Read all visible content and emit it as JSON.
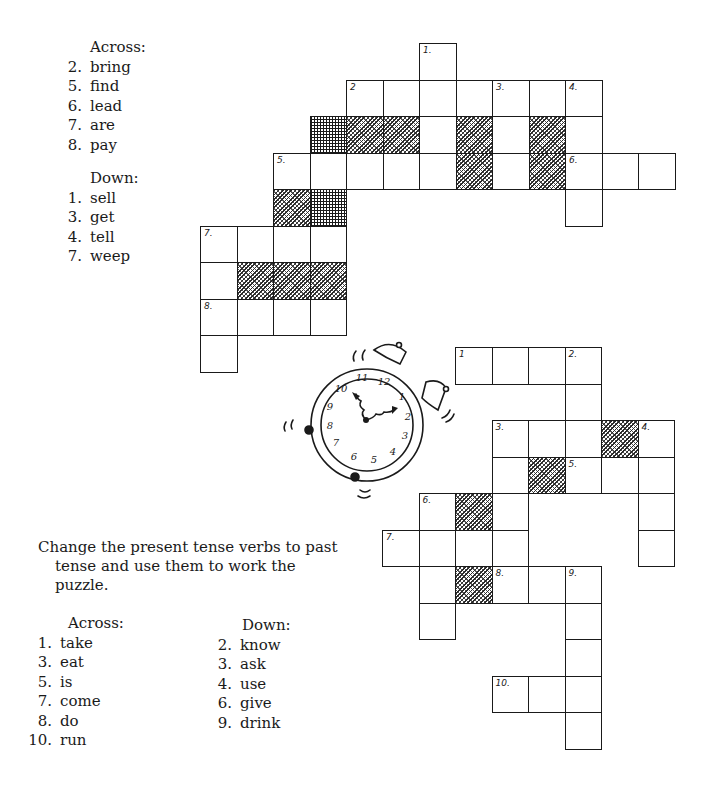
{
  "puzzle_top": {
    "across_header": "Across:",
    "across": [
      {
        "num": "2.",
        "word": "bring"
      },
      {
        "num": "5.",
        "word": "find"
      },
      {
        "num": "6.",
        "word": "lead"
      },
      {
        "num": "7.",
        "word": "are"
      },
      {
        "num": "8.",
        "word": "pay"
      }
    ],
    "down_header": "Down:",
    "down": [
      {
        "num": "1.",
        "word": "sell"
      },
      {
        "num": "3.",
        "word": "get"
      },
      {
        "num": "4.",
        "word": "tell"
      },
      {
        "num": "7.",
        "word": "weep"
      }
    ],
    "grid": {
      "origin": [
        200,
        43
      ],
      "cell": 36.5,
      "cells": [
        {
          "r": 0,
          "c": 6,
          "label": "1."
        },
        {
          "r": 1,
          "c": 4,
          "label": "2"
        },
        {
          "r": 1,
          "c": 5
        },
        {
          "r": 1,
          "c": 6
        },
        {
          "r": 1,
          "c": 7
        },
        {
          "r": 1,
          "c": 8,
          "label": "3."
        },
        {
          "r": 1,
          "c": 9
        },
        {
          "r": 1,
          "c": 10,
          "label": "4."
        },
        {
          "r": 2,
          "c": 3,
          "shade": "x"
        },
        {
          "r": 2,
          "c": 4,
          "shade": "d"
        },
        {
          "r": 2,
          "c": 5,
          "shade": "d"
        },
        {
          "r": 2,
          "c": 6
        },
        {
          "r": 2,
          "c": 7,
          "shade": "d"
        },
        {
          "r": 2,
          "c": 8
        },
        {
          "r": 2,
          "c": 9,
          "shade": "d"
        },
        {
          "r": 2,
          "c": 10
        },
        {
          "r": 3,
          "c": 2,
          "label": "5."
        },
        {
          "r": 3,
          "c": 3
        },
        {
          "r": 3,
          "c": 4
        },
        {
          "r": 3,
          "c": 5
        },
        {
          "r": 3,
          "c": 6
        },
        {
          "r": 3,
          "c": 7,
          "shade": "d"
        },
        {
          "r": 3,
          "c": 8
        },
        {
          "r": 3,
          "c": 9,
          "shade": "d"
        },
        {
          "r": 3,
          "c": 10,
          "label": "6."
        },
        {
          "r": 3,
          "c": 11
        },
        {
          "r": 3,
          "c": 12
        },
        {
          "r": 4,
          "c": 2,
          "shade": "d"
        },
        {
          "r": 4,
          "c": 3,
          "shade": "x"
        },
        {
          "r": 4,
          "c": 10
        },
        {
          "r": 5,
          "c": 0,
          "label": "7."
        },
        {
          "r": 5,
          "c": 1
        },
        {
          "r": 5,
          "c": 2
        },
        {
          "r": 5,
          "c": 3
        },
        {
          "r": 6,
          "c": 0
        },
        {
          "r": 6,
          "c": 1,
          "shade": "d"
        },
        {
          "r": 6,
          "c": 2,
          "shade": "d"
        },
        {
          "r": 6,
          "c": 3,
          "shade": "d"
        },
        {
          "r": 7,
          "c": 0,
          "label": "8."
        },
        {
          "r": 7,
          "c": 1
        },
        {
          "r": 7,
          "c": 2
        },
        {
          "r": 7,
          "c": 3
        },
        {
          "r": 8,
          "c": 0
        }
      ]
    }
  },
  "instructions": {
    "line1": "Change the present tense verbs to past",
    "line2": "tense and use them to work the",
    "line3": "puzzle."
  },
  "puzzle_bottom": {
    "across_header": "Across:",
    "across": [
      {
        "num": "1.",
        "word": "take"
      },
      {
        "num": "3.",
        "word": "eat"
      },
      {
        "num": "5.",
        "word": "is"
      },
      {
        "num": "7.",
        "word": "come"
      },
      {
        "num": "8.",
        "word": "do"
      },
      {
        "num": "10.",
        "word": "run"
      }
    ],
    "down_header": "Down:",
    "down": [
      {
        "num": "2.",
        "word": "know"
      },
      {
        "num": "3.",
        "word": "ask"
      },
      {
        "num": "4.",
        "word": "use"
      },
      {
        "num": "6.",
        "word": "give"
      },
      {
        "num": "9.",
        "word": "drink"
      }
    ],
    "grid": {
      "origin": [
        382,
        347
      ],
      "cell": 36.5,
      "cells": [
        {
          "r": 0,
          "c": 2,
          "label": "1"
        },
        {
          "r": 0,
          "c": 3
        },
        {
          "r": 0,
          "c": 4
        },
        {
          "r": 0,
          "c": 5,
          "label": "2."
        },
        {
          "r": 1,
          "c": 5
        },
        {
          "r": 2,
          "c": 3,
          "label": "3."
        },
        {
          "r": 2,
          "c": 4
        },
        {
          "r": 2,
          "c": 5
        },
        {
          "r": 2,
          "c": 6,
          "shade": "d"
        },
        {
          "r": 2,
          "c": 7,
          "label": "4."
        },
        {
          "r": 3,
          "c": 3
        },
        {
          "r": 3,
          "c": 4,
          "shade": "d"
        },
        {
          "r": 3,
          "c": 5,
          "label": "5."
        },
        {
          "r": 3,
          "c": 6
        },
        {
          "r": 3,
          "c": 7
        },
        {
          "r": 4,
          "c": 1,
          "label": "6."
        },
        {
          "r": 4,
          "c": 2,
          "shade": "d"
        },
        {
          "r": 4,
          "c": 3
        },
        {
          "r": 4,
          "c": 7
        },
        {
          "r": 5,
          "c": 0,
          "label": "7."
        },
        {
          "r": 5,
          "c": 1
        },
        {
          "r": 5,
          "c": 2
        },
        {
          "r": 5,
          "c": 3
        },
        {
          "r": 5,
          "c": 7
        },
        {
          "r": 6,
          "c": 1
        },
        {
          "r": 6,
          "c": 2,
          "shade": "d"
        },
        {
          "r": 6,
          "c": 3,
          "label": "8."
        },
        {
          "r": 6,
          "c": 4
        },
        {
          "r": 6,
          "c": 5,
          "label": "9."
        },
        {
          "r": 7,
          "c": 1
        },
        {
          "r": 7,
          "c": 5
        },
        {
          "r": 8,
          "c": 5
        },
        {
          "r": 9,
          "c": 3,
          "label": "10."
        },
        {
          "r": 9,
          "c": 4
        },
        {
          "r": 9,
          "c": 5
        },
        {
          "r": 10,
          "c": 5
        }
      ]
    }
  },
  "clock": {
    "icon": "alarm-clock-icon",
    "numerals": [
      "12",
      "1",
      "2",
      "3",
      "4",
      "5",
      "6",
      "7",
      "8",
      "9",
      "10",
      "11"
    ]
  }
}
